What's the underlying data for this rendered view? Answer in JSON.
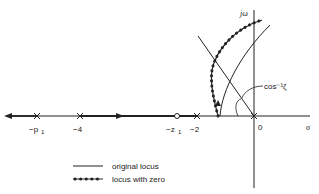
{
  "diagram": {
    "type": "root-locus",
    "axes": {
      "real_axis_label": "σ",
      "imag_axis_label": "jω"
    },
    "real_axis_labels": [
      {
        "id": "p1",
        "text": "−p₁",
        "x": 37
      },
      {
        "id": "m4",
        "text": "−4",
        "x": 80
      },
      {
        "id": "z1",
        "text": "−z₁",
        "x": 177
      },
      {
        "id": "m2",
        "text": "−2",
        "x": 197
      },
      {
        "id": "zero",
        "text": "0",
        "x": 258
      }
    ],
    "poles": [
      {
        "label": "−p₁",
        "x": 37
      },
      {
        "label": "−4",
        "x": 80
      },
      {
        "label": "−2",
        "x": 197
      },
      {
        "label": "0",
        "x": 254
      }
    ],
    "zeros": [
      {
        "label": "−z₁",
        "x": 177
      }
    ],
    "angle_annotation": "cos⁻¹ζ",
    "legend": [
      {
        "style": "solid",
        "label": "original locus"
      },
      {
        "style": "dotted",
        "label": "locus with zero"
      }
    ]
  }
}
